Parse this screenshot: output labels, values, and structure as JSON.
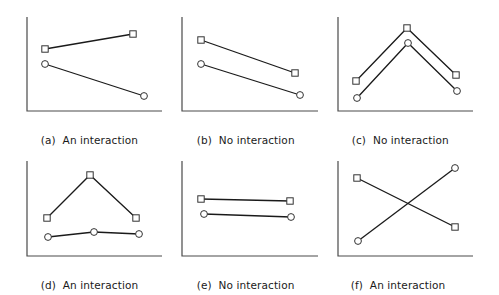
{
  "figure": {
    "colors": {
      "line": "#1a1a1a",
      "axis": "#4a4a4a",
      "marker_stroke": "#333333",
      "marker_fill": "#ffffff"
    },
    "panels": [
      {
        "id": "a",
        "tag": "(a)",
        "caption": "An interaction"
      },
      {
        "id": "b",
        "tag": "(b)",
        "caption": "No interaction"
      },
      {
        "id": "c",
        "tag": "(c)",
        "caption": "No interaction"
      },
      {
        "id": "d",
        "tag": "(d)",
        "caption": "An interaction"
      },
      {
        "id": "e",
        "tag": "(e)",
        "caption": "No interaction"
      },
      {
        "id": "f",
        "tag": "(f)",
        "caption": "An interaction"
      }
    ]
  },
  "chart_data": [
    {
      "type": "line",
      "title": "(a) An interaction",
      "xlabel": "",
      "ylabel": "",
      "grid": false,
      "legend": null,
      "axes_px": {
        "x0": 27,
        "y_top": 17,
        "y_base": 111,
        "x_end": 162
      },
      "series": [
        {
          "name": "square",
          "marker": "square",
          "points": [
            [
              45,
              49
            ],
            [
              133,
              34
            ]
          ]
        },
        {
          "name": "circle",
          "marker": "circle",
          "points": [
            [
              45,
              64
            ],
            [
              144,
              96
            ]
          ]
        }
      ]
    },
    {
      "type": "line",
      "title": "(b) No interaction",
      "xlabel": "",
      "ylabel": "",
      "grid": false,
      "legend": null,
      "axes_px": {
        "x0": 182,
        "y_top": 17,
        "y_base": 111,
        "x_end": 318
      },
      "series": [
        {
          "name": "square",
          "marker": "square",
          "points": [
            [
              201,
              40
            ],
            [
              295,
              73
            ]
          ]
        },
        {
          "name": "circle",
          "marker": "circle",
          "points": [
            [
              201,
              64
            ],
            [
              300,
              95
            ]
          ]
        }
      ]
    },
    {
      "type": "line",
      "title": "(c) No interaction",
      "xlabel": "",
      "ylabel": "",
      "grid": false,
      "legend": null,
      "axes_px": {
        "x0": 338,
        "y_top": 17,
        "y_base": 111,
        "x_end": 473
      },
      "series": [
        {
          "name": "square",
          "marker": "square",
          "points": [
            [
              356,
              81
            ],
            [
              407,
              28
            ],
            [
              456,
              75
            ]
          ]
        },
        {
          "name": "circle",
          "marker": "circle",
          "points": [
            [
              357,
              98
            ],
            [
              408,
              43
            ],
            [
              457,
              91
            ]
          ]
        }
      ]
    },
    {
      "type": "line",
      "title": "(d) An interaction",
      "xlabel": "",
      "ylabel": "",
      "grid": false,
      "legend": null,
      "axes_px": {
        "x0": 27,
        "y_top": 161,
        "y_base": 256,
        "x_end": 162
      },
      "series": [
        {
          "name": "square",
          "marker": "square",
          "points": [
            [
              47,
              218
            ],
            [
              90,
              175
            ],
            [
              136,
              218
            ]
          ]
        },
        {
          "name": "circle",
          "marker": "circle",
          "points": [
            [
              48,
              237
            ],
            [
              94,
              232
            ],
            [
              139,
              234
            ]
          ]
        }
      ]
    },
    {
      "type": "line",
      "title": "(e) No interaction",
      "xlabel": "",
      "ylabel": "",
      "grid": false,
      "legend": null,
      "axes_px": {
        "x0": 182,
        "y_top": 161,
        "y_base": 256,
        "x_end": 318
      },
      "series": [
        {
          "name": "square",
          "marker": "square",
          "points": [
            [
              201,
              199
            ],
            [
              290,
              201
            ]
          ]
        },
        {
          "name": "circle",
          "marker": "circle",
          "points": [
            [
              204,
              214
            ],
            [
              291,
              217
            ]
          ]
        }
      ]
    },
    {
      "type": "line",
      "title": "(f) An interaction",
      "xlabel": "",
      "ylabel": "",
      "grid": false,
      "legend": null,
      "axes_px": {
        "x0": 338,
        "y_top": 161,
        "y_base": 256,
        "x_end": 473
      },
      "series": [
        {
          "name": "square",
          "marker": "square",
          "points": [
            [
              357,
              178
            ],
            [
              455,
              227
            ]
          ]
        },
        {
          "name": "circle",
          "marker": "circle",
          "points": [
            [
              358,
              241
            ],
            [
              455,
              168
            ]
          ]
        }
      ]
    }
  ]
}
